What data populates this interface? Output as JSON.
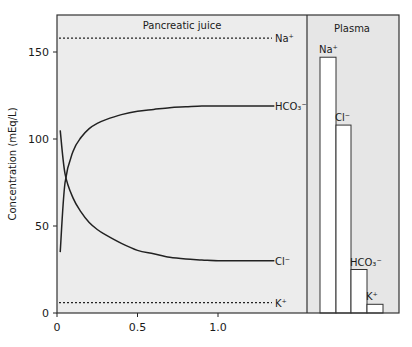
{
  "chart_data": {
    "type": "line",
    "title": "",
    "panels": [
      {
        "name": "Pancreatic juice"
      },
      {
        "name": "Plasma"
      }
    ],
    "xlabel": "",
    "ylabel": "Concentration (mEq/L)",
    "ylim": [
      0,
      170
    ],
    "xlim": [
      0,
      1.4
    ],
    "y_ticks": [
      0,
      50,
      100,
      150
    ],
    "x_ticks": [
      0,
      0.5,
      1.0
    ],
    "y_tick_labels": [
      "0",
      "50",
      "100",
      "150"
    ],
    "x_tick_labels": [
      "0",
      "0.5",
      "1.0"
    ],
    "grid": false,
    "series": [
      {
        "name": "Na+",
        "label": "Na⁺",
        "style": "dashed",
        "x": [
          0,
          1.35
        ],
        "y": [
          158,
          158
        ]
      },
      {
        "name": "HCO3-",
        "label": "HCO₃⁻",
        "style": "solid",
        "x": [
          0.02,
          0.05,
          0.1,
          0.15,
          0.2,
          0.25,
          0.3,
          0.4,
          0.5,
          0.6,
          0.7,
          0.8,
          0.9,
          1.0,
          1.1,
          1.2,
          1.35
        ],
        "y": [
          35,
          75,
          93,
          101,
          106,
          109,
          111,
          114,
          116,
          117,
          118,
          118.5,
          119,
          119,
          119,
          119,
          119
        ]
      },
      {
        "name": "Cl-",
        "label": "Cl⁻",
        "style": "solid",
        "x": [
          0.02,
          0.05,
          0.1,
          0.15,
          0.2,
          0.25,
          0.3,
          0.4,
          0.5,
          0.6,
          0.7,
          0.8,
          0.9,
          1.0,
          1.1,
          1.2,
          1.35
        ],
        "y": [
          105,
          80,
          66,
          58,
          52,
          48,
          45,
          40,
          36,
          34,
          32,
          31,
          30.5,
          30,
          30,
          30,
          30
        ]
      },
      {
        "name": "K+",
        "label": "K⁺",
        "style": "dashed",
        "x": [
          0,
          1.35
        ],
        "y": [
          6,
          6
        ]
      }
    ],
    "plasma_bars": {
      "type": "bar",
      "categories": [
        "Na+",
        "Cl-",
        "HCO3-",
        "K+"
      ],
      "labels": [
        "Na⁺",
        "Cl⁻",
        "HCO₃⁻",
        "K⁺"
      ],
      "values": [
        147,
        108,
        25,
        5
      ]
    }
  }
}
